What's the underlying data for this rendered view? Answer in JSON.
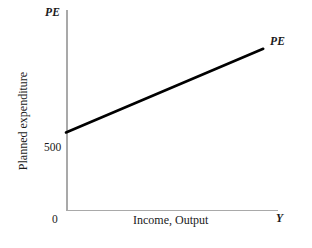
{
  "chart_data": {
    "type": "line",
    "title": "",
    "subtitle": "",
    "xlabel": "Income, Output",
    "ylabel": "Planned expenditure",
    "x_axis_end_label": "Y",
    "y_axis_top_label": "PE",
    "origin_label": "0",
    "grid": false,
    "legend": "none",
    "annotations": [
      {
        "name": "curve-label",
        "text": "PE",
        "position": "end-of-line-upper-right"
      }
    ],
    "y_ticks": [
      {
        "label": "500",
        "value": 500
      }
    ],
    "x_ticks": [
      {
        "label": "0",
        "value": 0
      }
    ],
    "series": [
      {
        "name": "PE",
        "label": "PE",
        "color": "#000000",
        "linewidth": 2.6,
        "description": "Planned expenditure schedule: upward sloping straight line with positive vertical intercept",
        "intercept": 500,
        "x": [
          0,
          1000
        ],
        "values": [
          500,
          1040
        ],
        "points": [
          {
            "x": 0,
            "y": 500
          },
          {
            "x": 1000,
            "y": 1040
          }
        ]
      }
    ],
    "xlim": [
      0,
      1075
    ],
    "ylim": [
      0,
      1290
    ],
    "axis_color": "#a9a9a9",
    "background_color": "#ffffff"
  },
  "figure": {
    "y_axis_title": "Planned expenditure",
    "x_axis_title": "Income, Output",
    "y_axis_top_label": "PE",
    "x_axis_end_label": "Y",
    "origin": "0",
    "intercept_tick": "500",
    "line_label": "PE"
  }
}
